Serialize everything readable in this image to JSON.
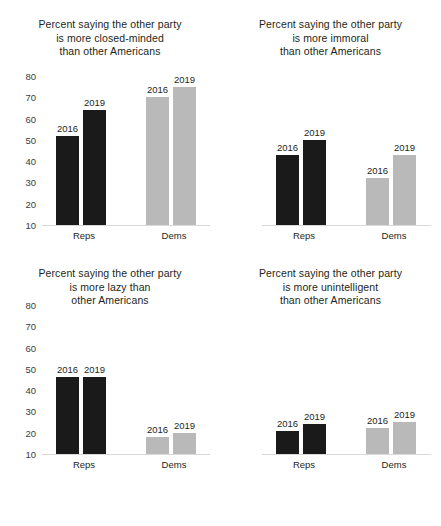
{
  "chart_data": [
    {
      "type": "bar",
      "title": "Percent saying the other party\nis more closed-minded\nthan other Americans",
      "xlabel": "",
      "ylabel": "",
      "ylim": [
        10,
        80
      ],
      "yticks": [
        "80",
        "70",
        "60",
        "50",
        "40",
        "30",
        "20",
        "10"
      ],
      "yticks_visible": true,
      "grid": false,
      "legend": "none",
      "categories": [
        "Reps",
        "Dems"
      ],
      "series": [
        {
          "name": "2016",
          "values": [
            52,
            70
          ]
        },
        {
          "name": "2019",
          "values": [
            64,
            75
          ]
        }
      ],
      "bar_colors": {
        "Reps": "#1a1a1a",
        "Dems": "#b9b9b9"
      },
      "data_labels": [
        [
          "2016",
          "2019"
        ],
        [
          "2016",
          "2019"
        ]
      ]
    },
    {
      "type": "bar",
      "title": "Percent saying the other party\nis more immoral\nthan other Americans",
      "xlabel": "",
      "ylabel": "",
      "ylim": [
        10,
        80
      ],
      "yticks": [
        "80",
        "70",
        "60",
        "50",
        "40",
        "30",
        "20",
        "10"
      ],
      "yticks_visible": false,
      "grid": false,
      "legend": "none",
      "categories": [
        "Reps",
        "Dems"
      ],
      "series": [
        {
          "name": "2016",
          "values": [
            43,
            32
          ]
        },
        {
          "name": "2019",
          "values": [
            50,
            43
          ]
        }
      ],
      "bar_colors": {
        "Reps": "#1a1a1a",
        "Dems": "#b9b9b9"
      },
      "data_labels": [
        [
          "2016",
          "2019"
        ],
        [
          "2016",
          "2019"
        ]
      ]
    },
    {
      "type": "bar",
      "title": "Percent saying the other party\nis more lazy than\nother Americans",
      "xlabel": "",
      "ylabel": "",
      "ylim": [
        10,
        80
      ],
      "yticks": [
        "80",
        "70",
        "60",
        "50",
        "40",
        "30",
        "20",
        "10"
      ],
      "yticks_visible": true,
      "grid": false,
      "legend": "none",
      "categories": [
        "Reps",
        "Dems"
      ],
      "series": [
        {
          "name": "2016",
          "values": [
            46,
            18
          ]
        },
        {
          "name": "2019",
          "values": [
            46,
            20
          ]
        }
      ],
      "bar_colors": {
        "Reps": "#1a1a1a",
        "Dems": "#b9b9b9"
      },
      "data_labels": [
        [
          "2016",
          "2019"
        ],
        [
          "2016",
          "2019"
        ]
      ]
    },
    {
      "type": "bar",
      "title": "Percent saying the other party\nis more unintelligent\nthan other Americans",
      "xlabel": "",
      "ylabel": "",
      "ylim": [
        10,
        80
      ],
      "yticks": [
        "80",
        "70",
        "60",
        "50",
        "40",
        "30",
        "20",
        "10"
      ],
      "yticks_visible": false,
      "grid": false,
      "legend": "none",
      "categories": [
        "Reps",
        "Dems"
      ],
      "series": [
        {
          "name": "2016",
          "values": [
            21,
            22
          ]
        },
        {
          "name": "2019",
          "values": [
            24,
            25
          ]
        }
      ],
      "bar_colors": {
        "Reps": "#1a1a1a",
        "Dems": "#b9b9b9"
      },
      "data_labels": [
        [
          "2016",
          "2019"
        ],
        [
          "2016",
          "2019"
        ]
      ]
    }
  ]
}
